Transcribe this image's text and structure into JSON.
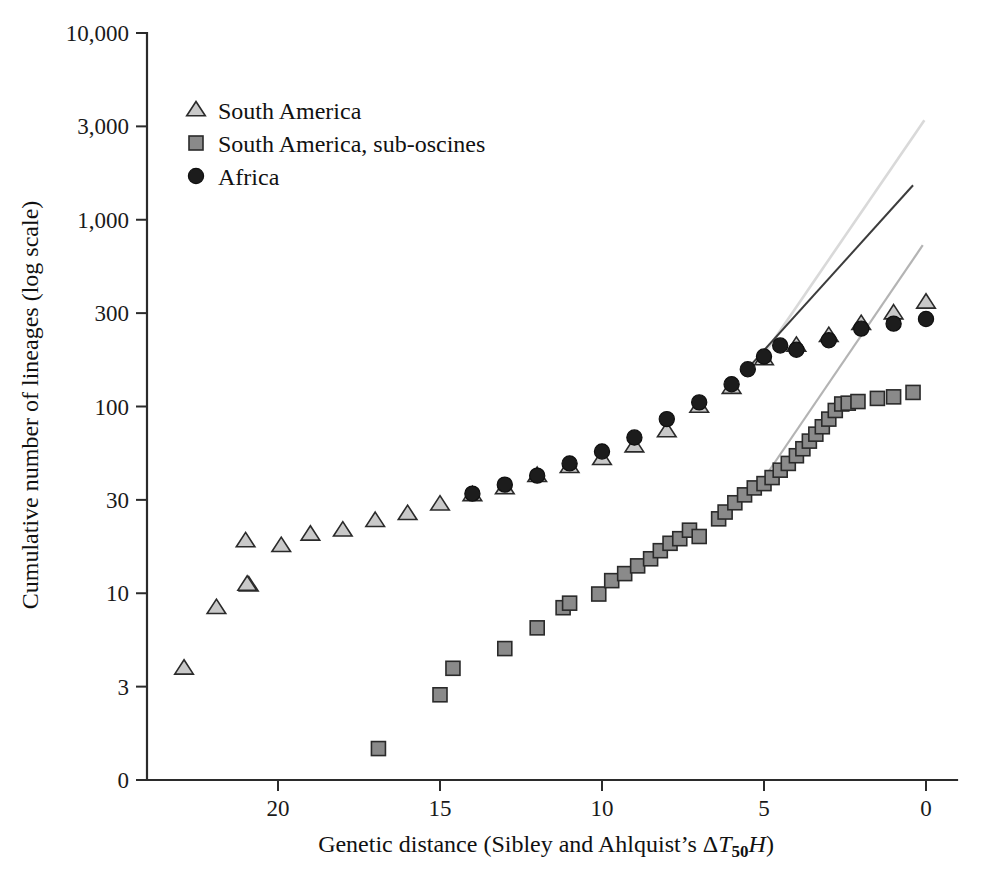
{
  "figure": {
    "width": 981,
    "height": 883,
    "background": "#ffffff"
  },
  "colors": {
    "axis": "#2b2b2b",
    "text": "#111111",
    "south_america": "#c9c9c9",
    "south_america_suboscines": "#8a8a8a",
    "africa": "#1c1c1c",
    "trend_light": "#d9d9d9",
    "trend_dark": "#3c3c3c",
    "trend_mid": "#b4b4b4"
  },
  "chart_data": {
    "type": "scatter",
    "title": "",
    "xlabel": "Genetic distance (Sibley and Ahlquist's ΔT50H)",
    "xlabel_parts": {
      "main": "Genetic distance (Sibley and Ahlquist’s ",
      "delta": "Δ",
      "t": "T",
      "subscript": "50",
      "h": "H",
      "close": ")"
    },
    "ylabel": "Cumulative number of lineages (log scale)",
    "xlim": [
      22.2,
      -0.7
    ],
    "xticks": [
      20,
      15,
      10,
      5,
      0
    ],
    "xtick_labels": [
      "20",
      "15",
      "10",
      "5",
      "0"
    ],
    "x_axis_reversed": true,
    "yticks": [
      10000,
      3000,
      1000,
      300,
      100,
      30,
      10,
      3,
      0
    ],
    "ytick_labels": [
      "10,000",
      "3,000",
      "1,000",
      "300",
      "100",
      "30",
      "10",
      "3",
      "0"
    ],
    "y_scale": "log",
    "grid": false,
    "legend_position": "top-left",
    "series": [
      {
        "name": "South America",
        "marker": "triangle",
        "color": "#c9c9c9",
        "points": [
          [
            22.9,
            3.8
          ],
          [
            21.9,
            8.3
          ],
          [
            20.9,
            11.0
          ],
          [
            19.9,
            17.5
          ],
          [
            20.95,
            11.1
          ],
          [
            21.0,
            18.5
          ],
          [
            19.0,
            20.0
          ],
          [
            18.0,
            21.0
          ],
          [
            17.0,
            23.5
          ],
          [
            16.0,
            25.5
          ],
          [
            15.0,
            28.5
          ],
          [
            14.0,
            32.0
          ],
          [
            13.0,
            35.0
          ],
          [
            12.0,
            41.0
          ],
          [
            11.0,
            46.0
          ],
          [
            10.0,
            51.0
          ],
          [
            9.0,
            60.0
          ],
          [
            8.0,
            73.0
          ],
          [
            7.0,
            100.0
          ],
          [
            6.0,
            125.0
          ],
          [
            5.0,
            175.0
          ],
          [
            4.0,
            205.0
          ],
          [
            3.0,
            230.0
          ],
          [
            2.0,
            265.0
          ],
          [
            1.0,
            300.0
          ],
          [
            0.0,
            345.0
          ]
        ]
      },
      {
        "name": "South America, sub-oscines",
        "marker": "square",
        "color": "#8a8a8a",
        "points": [
          [
            16.9,
            1.35
          ],
          [
            15.0,
            2.7
          ],
          [
            14.6,
            3.8
          ],
          [
            13.0,
            4.9
          ],
          [
            12.0,
            6.4
          ],
          [
            11.2,
            8.3
          ],
          [
            11.0,
            8.8
          ],
          [
            10.1,
            9.9
          ],
          [
            9.7,
            11.6
          ],
          [
            9.3,
            12.6
          ],
          [
            8.9,
            13.8
          ],
          [
            8.5,
            15.0
          ],
          [
            8.2,
            16.5
          ],
          [
            7.9,
            18.0
          ],
          [
            7.6,
            19.0
          ],
          [
            7.3,
            21.0
          ],
          [
            7.0,
            19.5
          ],
          [
            6.4,
            24.0
          ],
          [
            6.2,
            26.0
          ],
          [
            5.9,
            29.0
          ],
          [
            5.6,
            32.0
          ],
          [
            5.3,
            35.0
          ],
          [
            5.0,
            37.0
          ],
          [
            4.75,
            40.0
          ],
          [
            4.5,
            44.0
          ],
          [
            4.25,
            48.0
          ],
          [
            4.0,
            53.0
          ],
          [
            3.8,
            58.0
          ],
          [
            3.6,
            64.0
          ],
          [
            3.4,
            70.0
          ],
          [
            3.2,
            77.0
          ],
          [
            3.0,
            85.0
          ],
          [
            2.8,
            95.0
          ],
          [
            2.6,
            103.0
          ],
          [
            2.4,
            104.0
          ],
          [
            2.1,
            106.0
          ],
          [
            1.5,
            110.0
          ],
          [
            1.0,
            112.0
          ],
          [
            0.4,
            118.0
          ]
        ]
      },
      {
        "name": "Africa",
        "marker": "circle",
        "color": "#1c1c1c",
        "points": [
          [
            14.0,
            32.5
          ],
          [
            13.0,
            36.5
          ],
          [
            12.0,
            41.0
          ],
          [
            11.0,
            48.0
          ],
          [
            10.0,
            56.0
          ],
          [
            9.0,
            67.0
          ],
          [
            8.0,
            85.0
          ],
          [
            7.0,
            105.0
          ],
          [
            6.0,
            130.0
          ],
          [
            5.5,
            155.0
          ],
          [
            5.0,
            180.0
          ],
          [
            4.5,
            205.0
          ],
          [
            4.0,
            195.0
          ],
          [
            3.0,
            218.0
          ],
          [
            2.0,
            250.0
          ],
          [
            1.0,
            265.0
          ],
          [
            0.0,
            280.0
          ]
        ]
      }
    ],
    "trend_lines": [
      {
        "name": "south-america-trend",
        "color": "#d9d9d9",
        "width": 2.6,
        "start": [
          5.1,
          175
        ],
        "end": [
          0.05,
          3250
        ]
      },
      {
        "name": "africa-trend",
        "color": "#3c3c3c",
        "width": 2.0,
        "start": [
          5.45,
          160
        ],
        "end": [
          0.4,
          1500
        ]
      },
      {
        "name": "sub-oscines-trend",
        "color": "#b4b4b4",
        "width": 2.2,
        "start": [
          5.3,
          33
        ],
        "end": [
          0.1,
          720
        ]
      }
    ]
  },
  "legend": {
    "items": [
      {
        "label": "South America",
        "marker": "triangle",
        "color": "#c9c9c9"
      },
      {
        "label": "South America, sub-oscines",
        "marker": "square",
        "color": "#8a8a8a"
      },
      {
        "label": "Africa",
        "marker": "circle",
        "color": "#1c1c1c"
      }
    ]
  }
}
